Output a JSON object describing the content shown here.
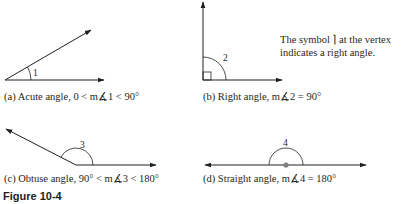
{
  "panels": [
    {
      "id": "a",
      "caption": "(a) Acute angle,  0 < m∡1 < 90°",
      "angle_label": "1",
      "type": "acute"
    },
    {
      "id": "b",
      "caption": "(b) Right angle,  m∡2 = 90°",
      "angle_label": "2",
      "type": "right"
    },
    {
      "id": "c",
      "caption": "(c) Obtuse angle,  90° < m∡3 < 180°",
      "angle_label": "3",
      "type": "obtuse"
    },
    {
      "id": "d",
      "caption": "(d) Straight angle,  m∡4 = 180°",
      "angle_label": "4",
      "type": "straight"
    }
  ],
  "note": {
    "line1": "The symbol  ⌉  at the vertex",
    "line2": "indicates a right angle."
  },
  "figure_title": "Figure 10-4",
  "colors": {
    "line": "#231f20",
    "vertex_dot": "#808080"
  }
}
